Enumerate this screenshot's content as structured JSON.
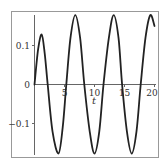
{
  "chart_data": {
    "type": "line",
    "title": "",
    "xlabel": "t",
    "ylabel": "",
    "xlim": [
      0,
      20
    ],
    "ylim": [
      -0.19,
      0.19
    ],
    "grid": false,
    "legend": null,
    "x_ticks": [
      0,
      5,
      10,
      15,
      20
    ],
    "x_tick_labels": [
      "5",
      "10",
      "15",
      "20"
    ],
    "y_ticks": [
      0.1,
      0,
      -0.1
    ],
    "y_tick_labels": [
      "0.1",
      "0",
      "-0.1"
    ],
    "series": [
      {
        "name": "y(t)",
        "color": "#222222",
        "x": [
          0,
          0.6,
          1.2,
          1.7,
          2.2,
          3.0,
          4.0,
          4.7,
          5.3,
          6.0,
          6.8,
          7.6,
          8.3,
          9.2,
          10.0,
          10.8,
          11.5,
          12.4,
          13.2,
          14.0,
          14.6,
          15.4,
          16.2,
          17.0,
          17.7,
          18.5,
          19.3,
          20.0
        ],
        "y": [
          0,
          0.09,
          0.128,
          0.08,
          0,
          -0.12,
          -0.177,
          -0.11,
          0,
          0.12,
          0.178,
          0.12,
          0,
          -0.12,
          -0.177,
          -0.12,
          0,
          0.12,
          0.178,
          0.12,
          0,
          -0.12,
          -0.177,
          -0.12,
          0,
          0.12,
          0.178,
          0.15
        ]
      }
    ]
  },
  "colors": {
    "frame": "#888888",
    "axis": "#555555",
    "curve": "#222222"
  }
}
